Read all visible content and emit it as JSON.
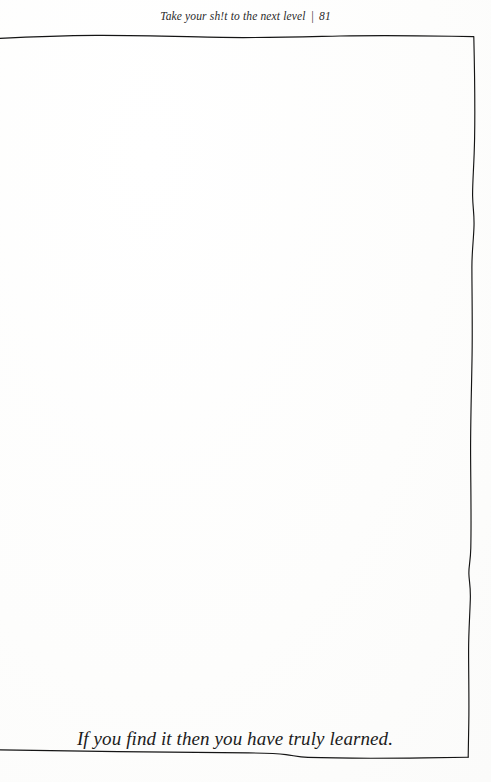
{
  "page": {
    "background_color": "#ffffff",
    "ink_color": "#141414"
  },
  "running_head": {
    "book_title": "Take your sh!t to the next level",
    "separator": "|",
    "folio": "81"
  },
  "frame": {
    "name": "hand-drawn-rectangle-border",
    "style": "hand drawn wavy rectangle, open at left page edge"
  },
  "body": {
    "content": ""
  },
  "caption": {
    "text": "If you find it then you have truly learned."
  }
}
